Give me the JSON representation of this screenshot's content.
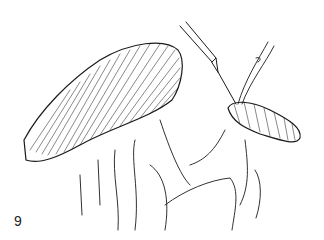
{
  "figure": {
    "label": "9",
    "colors": {
      "ink": "#1a1a1a",
      "background": "#ffffff"
    }
  }
}
